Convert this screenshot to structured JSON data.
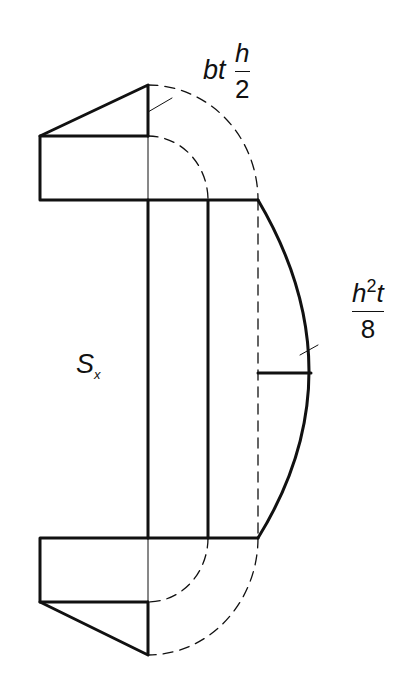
{
  "diagram": {
    "labels": {
      "section_modulus": {
        "symbol": "S",
        "subscript": "x"
      },
      "flange_moment": {
        "prefix": "bt",
        "numerator": "h",
        "denominator": "2"
      },
      "web_moment": {
        "numerator_base": "h",
        "numerator_exp": "2",
        "numerator_suffix": "t",
        "denominator": "8"
      }
    },
    "colors": {
      "stroke": "#111111",
      "background": "#ffffff"
    }
  }
}
